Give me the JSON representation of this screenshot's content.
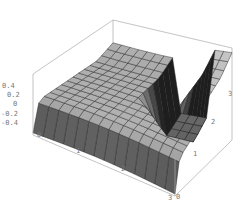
{
  "chart_data": {
    "type": "surface3d",
    "title": "",
    "xlabel": "",
    "ylabel": "",
    "zlabel": "",
    "x_ticks": [
      "0",
      "1",
      "2",
      "3"
    ],
    "y_ticks": [
      "0",
      "1",
      "2",
      "3"
    ],
    "z_ticks": [
      "0.4",
      "0.2",
      "0",
      "-0.2",
      "-0.4"
    ],
    "xlim": [
      0,
      3
    ],
    "ylim": [
      0,
      3
    ],
    "zlim": [
      -0.4,
      0.4
    ],
    "box": true,
    "grid": false,
    "legend": null,
    "shading": "grayscale"
  },
  "axes": {
    "z_labels": [
      "0.4",
      "0.2",
      "0",
      "-0.2",
      "-0.4"
    ],
    "x_labels": [
      "0",
      "1",
      "2",
      "3"
    ],
    "y_labels": [
      "0",
      "1",
      "2",
      "3"
    ]
  }
}
